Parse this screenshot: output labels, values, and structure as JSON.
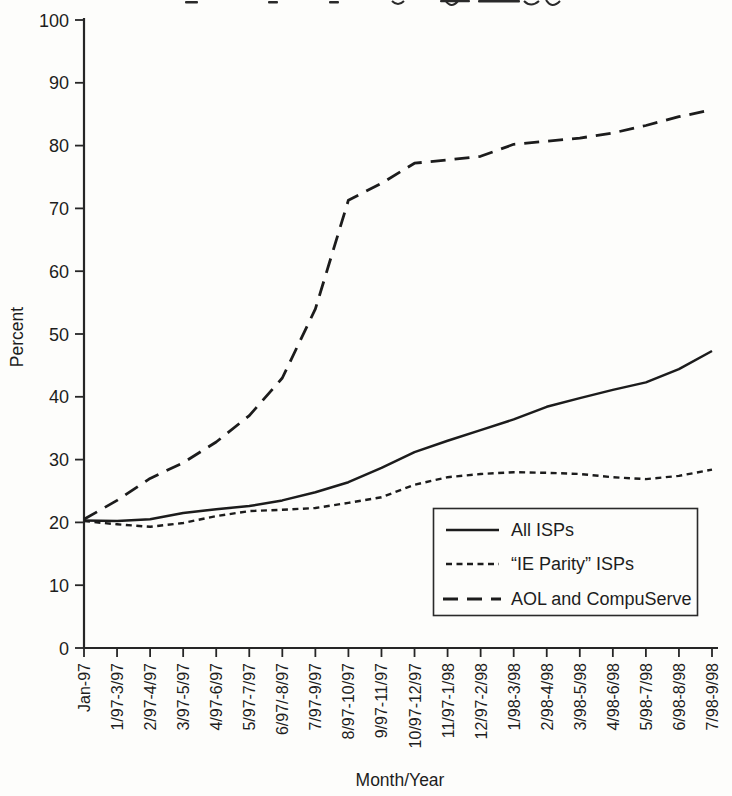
{
  "chart_data": {
    "type": "line",
    "title": "",
    "title_cropped_top": true,
    "xlabel": "Month/Year",
    "ylabel": "Percent",
    "ylim": [
      0,
      100
    ],
    "ytick_step": 10,
    "grid": false,
    "legend_position": "inside-right-lower",
    "line_color": "#1c1c1c",
    "background_color": "#fdfdfb",
    "categories": [
      "Jan-97",
      "1/97-3/97",
      "2/97-4/97",
      "3/97-5/97",
      "4/97-6/97",
      "5/97-7/97",
      "6/97/-8/97",
      "7/97-9/97",
      "8/97-10/97",
      "9/97-11/97",
      "10/97-12/97",
      "11/97-1/98",
      "12/97-2/98",
      "1/98-3/98",
      "2/98-4/98",
      "3/98-5/98",
      "4/98-6/98",
      "5/98-7/98",
      "6/98-8/98",
      "7/98-9/98"
    ],
    "series": [
      {
        "name": "All ISPs",
        "line_style": "solid",
        "values": [
          20.3,
          20.2,
          20.5,
          21.5,
          22.1,
          22.6,
          23.5,
          24.8,
          26.4,
          28.7,
          31.2,
          33.0,
          34.7,
          36.4,
          38.4,
          39.8,
          41.1,
          42.3,
          44.4,
          47.3
        ]
      },
      {
        "name": "“IE Parity” ISPs",
        "line_style": "dashed-short",
        "values": [
          20.2,
          19.7,
          19.3,
          19.9,
          21.0,
          21.8,
          22.0,
          22.3,
          23.1,
          24.0,
          26.0,
          27.2,
          27.7,
          28.0,
          27.9,
          27.7,
          27.2,
          26.9,
          27.4,
          28.4
        ]
      },
      {
        "name": "AOL and CompuServe",
        "line_style": "dashed-long",
        "values": [
          20.5,
          23.5,
          27.0,
          29.5,
          32.8,
          37.0,
          43.0,
          54.0,
          71.3,
          74.0,
          77.2,
          77.7,
          78.3,
          80.2,
          80.7,
          81.2,
          82.0,
          83.2,
          84.6,
          85.7
        ]
      }
    ]
  }
}
